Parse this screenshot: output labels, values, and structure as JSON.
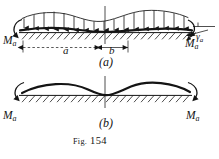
{
  "figure": {
    "caption_prefix": "Fig.",
    "caption_number": "154",
    "caption_full": "Fig. 154",
    "background_color": "#ffffff",
    "ink_color": "#141414",
    "parts": [
      {
        "key": "a",
        "label": "(a)",
        "description": "continuous beam on elastic foundation with distributed load and end moments"
      },
      {
        "key": "b",
        "label": "(b)",
        "description": "deflected shape of the beam with end moments only"
      }
    ],
    "labels": {
      "moment_top_left": {
        "symbol": "M",
        "subscript": "a",
        "text": "Ma"
      },
      "moment_top_right": {
        "symbol": "M",
        "subscript": "a",
        "text": "Ma"
      },
      "moment_bottom_left": {
        "symbol": "M",
        "subscript": "a",
        "text": "Ma"
      },
      "moment_bottom_right": {
        "symbol": "M",
        "subscript": "a",
        "text": "Ma"
      },
      "dimension_a": "a",
      "dimension_b": "b",
      "angle": {
        "symbol": "γ",
        "subscript": "a",
        "text": "γa"
      }
    },
    "annotations": {
      "load_arrow_count": 16,
      "dimension_a_style": "dashed-double-arrow",
      "dimension_b_style": "solid-double-arrow",
      "foundation_style": "hatched",
      "moment_arrow_style": "curved-arc-arrow"
    }
  }
}
